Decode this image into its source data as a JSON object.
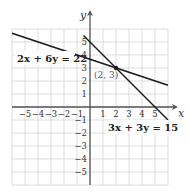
{
  "chart_data": {
    "type": "line",
    "title": "",
    "xlabel": "x",
    "ylabel": "y",
    "xlim": [
      -6,
      6
    ],
    "ylim": [
      -6,
      6
    ],
    "grid": true,
    "x_ticks": [
      -5,
      -4,
      -3,
      -2,
      -1,
      1,
      2,
      3,
      4,
      5
    ],
    "y_ticks": [
      5,
      4,
      3,
      2,
      1,
      -1,
      -2,
      -3,
      -4,
      -5
    ],
    "x_tick_labels": [
      "−5",
      "−4",
      "−3",
      "−2",
      "−1",
      "1",
      "2",
      "3",
      "4",
      "5"
    ],
    "y_tick_labels": [
      "5",
      "4",
      "3",
      "2",
      "1",
      "−1",
      "−2",
      "−3",
      "−4",
      "−5"
    ],
    "series": [
      {
        "name": "2x + 6y = 22",
        "equation": "2x + 6y = 22",
        "x": [
          -6,
          6
        ],
        "y": [
          5.6667,
          1.6667
        ]
      },
      {
        "name": "3x + 3y = 15",
        "equation": "3x + 3y = 15",
        "x": [
          -0.5,
          6
        ],
        "y": [
          5.5,
          -1
        ]
      }
    ],
    "annotations": [
      {
        "text": "(2, 3)",
        "x": 2,
        "y": 3,
        "type": "intersection-point"
      }
    ]
  },
  "labels": {
    "x_axis": "x",
    "y_axis": "y",
    "line1": "2x + 6y = 22",
    "line2": "3x + 3y = 15",
    "intersection": "(2, 3)"
  },
  "colors": {
    "grid": "#d4d4d4",
    "axis": "#555555",
    "line": "#1a1a1a",
    "background": "#ffffff"
  }
}
